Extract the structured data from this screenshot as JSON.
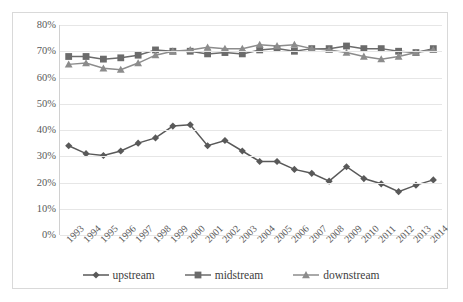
{
  "chart_data": {
    "type": "line",
    "title": "",
    "subtitle": "",
    "xlabel": "",
    "ylabel": "",
    "ylim": [
      0,
      80
    ],
    "ytick_labels": [
      "0%",
      "10%",
      "20%",
      "30%",
      "40%",
      "50%",
      "60%",
      "70%",
      "80%"
    ],
    "ytick_values": [
      0,
      10,
      20,
      30,
      40,
      50,
      60,
      70,
      80
    ],
    "grid": true,
    "legend_position": "bottom",
    "categories": [
      "1993",
      "1994",
      "1995",
      "1996",
      "1997",
      "1998",
      "1999",
      "2000",
      "2001",
      "2002",
      "2003",
      "2004",
      "2005",
      "2006",
      "2007",
      "2008",
      "2009",
      "2010",
      "2011",
      "2012",
      "2013",
      "2014"
    ],
    "series": [
      {
        "name": "upstream",
        "marker": "diamond",
        "color": "#595959",
        "values": [
          34.0,
          31.0,
          30.3,
          32.0,
          35.0,
          37.0,
          41.5,
          42.0,
          34.0,
          36.0,
          32.0,
          28.0,
          28.0,
          25.0,
          23.5,
          20.5,
          26.0,
          21.5,
          19.5,
          16.5,
          19.0,
          21.0
        ]
      },
      {
        "name": "midstream",
        "marker": "square",
        "color": "#6b6b6b",
        "values": [
          68.0,
          68.0,
          67.0,
          67.5,
          68.5,
          70.5,
          70.0,
          70.0,
          69.0,
          69.5,
          69.0,
          70.5,
          71.0,
          70.0,
          71.0,
          71.0,
          72.0,
          71.0,
          71.0,
          70.0,
          69.5,
          71.0
        ]
      },
      {
        "name": "downstream",
        "marker": "triangle",
        "color": "#8c8c8c",
        "values": [
          65.0,
          65.5,
          63.5,
          63.0,
          65.5,
          68.5,
          70.0,
          70.5,
          71.5,
          71.0,
          71.0,
          72.5,
          72.0,
          72.5,
          71.0,
          70.5,
          69.5,
          68.0,
          67.0,
          68.0,
          69.5,
          70.5
        ]
      }
    ]
  },
  "legend": {
    "items": [
      {
        "label": "upstream"
      },
      {
        "label": "midstream"
      },
      {
        "label": "downstream"
      }
    ]
  },
  "colors": {
    "upstream": "#595959",
    "midstream": "#6b6b6b",
    "downstream": "#8c8c8c",
    "gridline": "#e6e6e6",
    "border": "#d9d9d9",
    "text": "#595959"
  }
}
